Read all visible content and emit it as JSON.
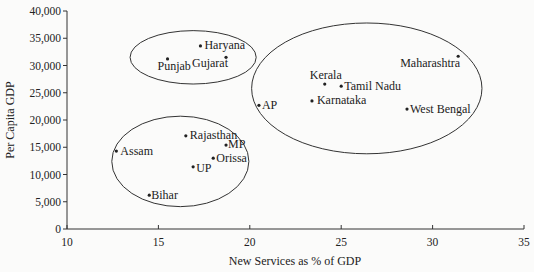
{
  "chart_data": {
    "type": "scatter",
    "title": "",
    "xlabel": "New Services as % of GDP",
    "ylabel": "Per Capita GDP",
    "xlim": [
      10,
      35
    ],
    "ylim": [
      0,
      40000
    ],
    "x_ticks": [
      "10",
      "15",
      "20",
      "25",
      "30",
      "35"
    ],
    "y_ticks": [
      "0",
      "5,000",
      "10,000",
      "15,000",
      "20,000",
      "25,000",
      "30,000",
      "35,000",
      "40,000"
    ],
    "grid": false,
    "legend": null,
    "points": [
      {
        "label": "Haryana",
        "x": 17.3,
        "y": 33600,
        "lx": 4,
        "ly": 3,
        "anchor": "start"
      },
      {
        "label": "Punjab",
        "x": 15.5,
        "y": 31200,
        "lx": -10,
        "ly": 11,
        "anchor": "start"
      },
      {
        "label": "Gujarat",
        "x": 18.7,
        "y": 31500,
        "lx": -34,
        "ly": 10,
        "anchor": "start"
      },
      {
        "label": "Maharashtra",
        "x": 31.4,
        "y": 31700,
        "lx": -58,
        "ly": 11,
        "anchor": "start"
      },
      {
        "label": "Kerala",
        "x": 24.1,
        "y": 26600,
        "lx": -15,
        "ly": -5,
        "anchor": "start"
      },
      {
        "label": "Tamil Nadu",
        "x": 25.0,
        "y": 26200,
        "lx": 3,
        "ly": 4,
        "anchor": "start"
      },
      {
        "label": "Karnataka",
        "x": 23.4,
        "y": 23500,
        "lx": 5,
        "ly": 3,
        "anchor": "start"
      },
      {
        "label": "AP",
        "x": 20.5,
        "y": 22700,
        "lx": 3,
        "ly": 4,
        "anchor": "start"
      },
      {
        "label": "West Bengal",
        "x": 28.6,
        "y": 22000,
        "lx": 3,
        "ly": 4,
        "anchor": "start"
      },
      {
        "label": "Rajasthan",
        "x": 16.5,
        "y": 17100,
        "lx": 4,
        "ly": 3,
        "anchor": "start"
      },
      {
        "label": "MP",
        "x": 18.7,
        "y": 15400,
        "lx": 2,
        "ly": 3,
        "anchor": "start"
      },
      {
        "label": "Orissa",
        "x": 18.0,
        "y": 13000,
        "lx": 3,
        "ly": 4,
        "anchor": "start"
      },
      {
        "label": "UP",
        "x": 16.9,
        "y": 11400,
        "lx": 3,
        "ly": 5,
        "anchor": "start"
      },
      {
        "label": "Assam",
        "x": 12.7,
        "y": 14300,
        "lx": 4,
        "ly": 4,
        "anchor": "start"
      },
      {
        "label": "Bihar",
        "x": 14.5,
        "y": 6200,
        "lx": 2,
        "ly": 4,
        "anchor": "start"
      }
    ],
    "clusters": [
      {
        "name": "high-income-low-services",
        "cx": 16.9,
        "cy": 31500,
        "rx": 3.45,
        "ry": 4900
      },
      {
        "name": "high-services",
        "cx": 26.4,
        "cy": 25800,
        "rx": 6.3,
        "ry": 12000
      },
      {
        "name": "low-income",
        "cx": 16.2,
        "cy": 12400,
        "rx": 3.75,
        "ry": 8300
      }
    ]
  }
}
